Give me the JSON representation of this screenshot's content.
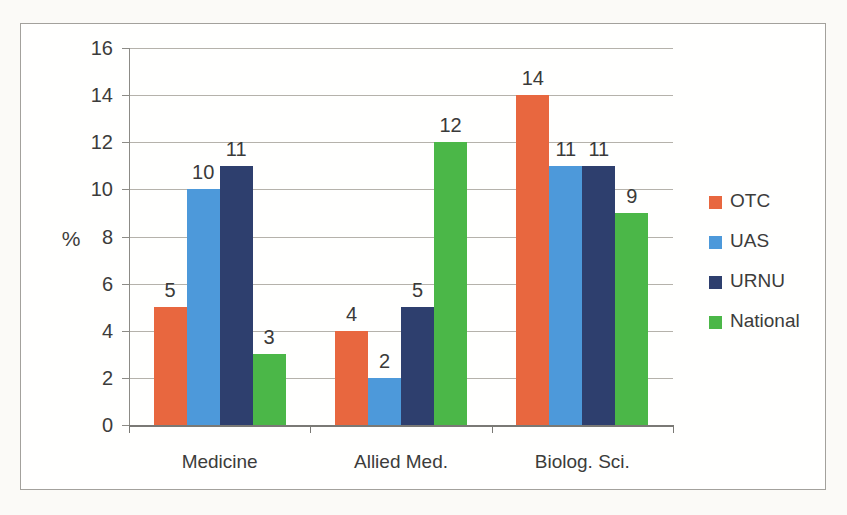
{
  "chart_data": {
    "type": "bar",
    "title": "",
    "categories": [
      "Medicine",
      "Allied Med.",
      "Biolog. Sci."
    ],
    "series": [
      {
        "name": "OTC",
        "color": "#e8673f",
        "values": [
          5,
          4,
          14
        ]
      },
      {
        "name": "UAS",
        "color": "#4d99da",
        "values": [
          10,
          2,
          11
        ]
      },
      {
        "name": "URNU",
        "color": "#2e3f6e",
        "values": [
          11,
          5,
          11
        ]
      },
      {
        "name": "National",
        "color": "#4bb748",
        "values": [
          3,
          12,
          9
        ]
      }
    ],
    "xlabel": "",
    "ylabel": "%",
    "ylim": [
      0,
      16
    ],
    "yticks": [
      0,
      2,
      4,
      6,
      8,
      10,
      12,
      14,
      16
    ],
    "grid": true,
    "bar_labels": true,
    "legend_position": "right"
  },
  "style_colors": {
    "grid": "#b5b2ab",
    "y_axis": "#8c8b86",
    "x_axis": "#7a7975",
    "text": "#3c3c3b",
    "frame_border": "#a3a19c",
    "plot_background": "#fffffe",
    "page_background": "#fbfaf7"
  }
}
